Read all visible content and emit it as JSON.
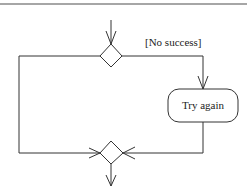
{
  "diagram": {
    "type": "UML activity diagram fragment",
    "nodes": [
      {
        "id": "decision",
        "kind": "decision-diamond"
      },
      {
        "id": "try_again",
        "kind": "action",
        "label": "Try again"
      },
      {
        "id": "merge",
        "kind": "merge-diamond"
      }
    ],
    "edges": [
      {
        "from": "incoming",
        "to": "decision"
      },
      {
        "from": "decision",
        "to": "try_again",
        "guard": "[No success]"
      },
      {
        "from": "decision",
        "to": "merge",
        "guard": ""
      },
      {
        "from": "try_again",
        "to": "merge"
      },
      {
        "from": "merge",
        "to": "outgoing"
      }
    ],
    "guard_label": "[No success]",
    "action_label": "Try again"
  },
  "colors": {
    "stroke": "#333333",
    "background": "#ffffff",
    "top_rule": "#888888"
  }
}
